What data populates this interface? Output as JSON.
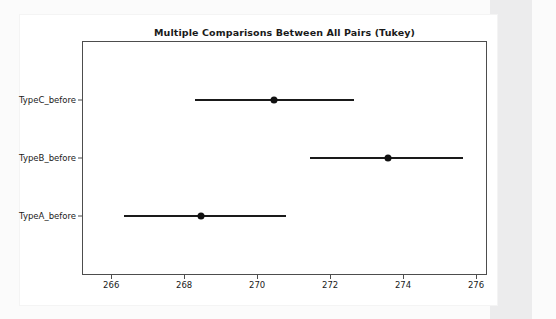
{
  "figure": {
    "background_color": "#ffffff",
    "page_color": "#fbfbfb",
    "band_color": "#ececed",
    "axes_color": "#4d4d4d",
    "data_color": "#1a1a1a"
  },
  "chart_data": {
    "type": "scatter",
    "title": "Multiple Comparisons Between All Pairs (Tukey)",
    "xlabel": "",
    "ylabel": "",
    "xlim": [
      265.2,
      276.3
    ],
    "xticks": [
      266,
      268,
      270,
      272,
      274,
      276
    ],
    "xtick_labels": [
      "266",
      "268",
      "270",
      "272",
      "274",
      "276"
    ],
    "categories": [
      "TypeA_before",
      "TypeB_before",
      "TypeC_before"
    ],
    "ytick_labels": [
      "TypeC_before",
      "TypeB_before",
      "TypeA_before"
    ],
    "grid": false,
    "legend": null,
    "orientation": "horizontal",
    "series": [
      {
        "name": "group mean with Tukey simultaneous confidence interval",
        "points": [
          {
            "label": "TypeC_before",
            "mean": 270.45,
            "lower": 268.3,
            "upper": 272.65
          },
          {
            "label": "TypeB_before",
            "mean": 273.6,
            "lower": 271.45,
            "upper": 275.65
          },
          {
            "label": "TypeA_before",
            "mean": 268.45,
            "lower": 266.35,
            "upper": 270.8
          }
        ]
      }
    ]
  }
}
